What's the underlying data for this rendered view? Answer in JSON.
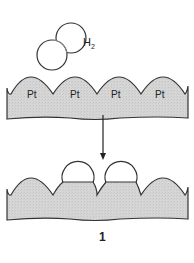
{
  "molecule": {
    "label": "H",
    "subscript": "2"
  },
  "surface_top": {
    "atom_labels": [
      "Pt",
      "Pt",
      "Pt",
      "Pt"
    ]
  },
  "figure_label": "1",
  "colors": {
    "surface_fill": "#d4d4d4",
    "stroke": "#333333",
    "background": "#ffffff"
  }
}
